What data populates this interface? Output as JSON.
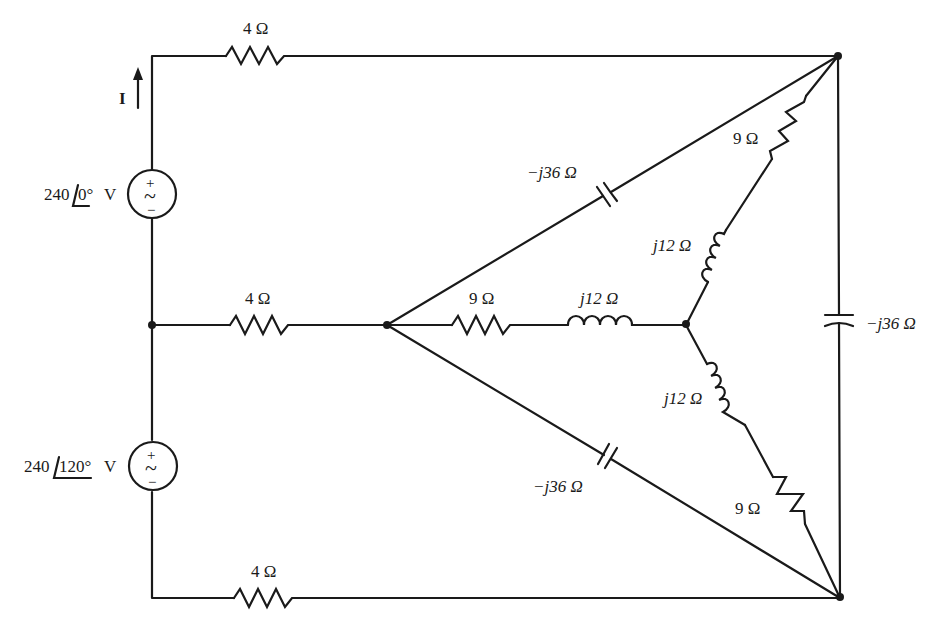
{
  "diagram": {
    "current_label": "I",
    "sources": [
      {
        "id": "source-top",
        "magnitude": "240",
        "angle": "0°",
        "unit": "V",
        "plus": "+",
        "minus": "−",
        "wave": "~"
      },
      {
        "id": "source-bottom",
        "magnitude": "240",
        "angle": "120°",
        "unit": "V",
        "plus": "+",
        "minus": "−",
        "wave": "~"
      }
    ],
    "line_resistors": [
      {
        "id": "line-top",
        "label": "4 Ω"
      },
      {
        "id": "line-middle",
        "label": "4 Ω"
      },
      {
        "id": "line-bottom",
        "label": "4 Ω"
      }
    ],
    "delta_capacitors": [
      {
        "id": "cap-upper-diagonal",
        "label": "−j36 Ω"
      },
      {
        "id": "cap-right-vertical",
        "label": "−j36 Ω"
      },
      {
        "id": "cap-lower-diagonal",
        "label": "−j36 Ω"
      }
    ],
    "wye_branches": [
      {
        "id": "wye-upper",
        "resistor": "9 Ω",
        "inductor": "j12 Ω"
      },
      {
        "id": "wye-middle",
        "resistor": "9 Ω",
        "inductor": "j12 Ω"
      },
      {
        "id": "wye-lower",
        "resistor": "9 Ω",
        "inductor": "j12 Ω"
      }
    ]
  }
}
